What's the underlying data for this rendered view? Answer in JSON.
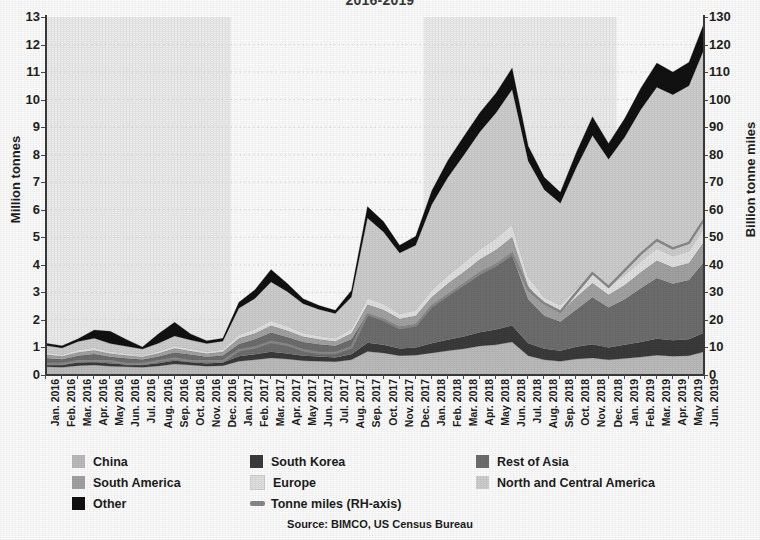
{
  "title": "2016-2019",
  "source": "Source: BIMCO, US Census Bureau",
  "axes": {
    "left_title": "Million tonnes",
    "right_title": "Billion tonne miles",
    "left_ticks": [
      "13",
      "12",
      "11",
      "10",
      "9",
      "8",
      "7",
      "6",
      "5",
      "4",
      "3",
      "2",
      "1",
      "0"
    ],
    "right_ticks": [
      "130",
      "120",
      "110",
      "100",
      "90",
      "80",
      "70",
      "60",
      "50",
      "40",
      "30",
      "20",
      "10",
      "0"
    ]
  },
  "colors": {
    "china": "#bdbdbd",
    "south_korea": "#3b3b3b",
    "rest_of_asia": "#6e6e6e",
    "south_america": "#a3a3a3",
    "europe": "#e2e2e2",
    "north_and_central_america": "#cfcfcf",
    "other": "#111111",
    "tonne_miles_line": "#8a8a8a",
    "band_shade": "#ededed",
    "gridline": "#d9d9d9",
    "axis": "#3b3b3b"
  },
  "legend": [
    {
      "label": "China",
      "marker": "square",
      "color_key": "china"
    },
    {
      "label": "South Korea",
      "marker": "square",
      "color_key": "south_korea"
    },
    {
      "label": "Rest of Asia",
      "marker": "square",
      "color_key": "rest_of_asia"
    },
    {
      "label": "South America",
      "marker": "square",
      "color_key": "south_america"
    },
    {
      "label": "Europe",
      "marker": "square",
      "color_key": "europe"
    },
    {
      "label": "North and Central America",
      "marker": "square",
      "color_key": "north_and_central_america"
    },
    {
      "label": "Other",
      "marker": "square",
      "color_key": "other"
    },
    {
      "label": "Tonne miles (RH-axis)",
      "marker": "line",
      "color_key": "tonne_miles_line"
    }
  ],
  "chart_data": {
    "type": "area",
    "stacked": true,
    "title": "2016-2019",
    "xlabel": "",
    "ylabel": "Million tonnes",
    "y2label": "Billion tonne miles",
    "ylim": [
      0,
      13
    ],
    "y2lim": [
      0,
      130
    ],
    "grid": true,
    "grid_style": "dotted-horizontal",
    "legend_position": "bottom",
    "shaded_year_bands": [
      "2016",
      "2018"
    ],
    "x": [
      "Jan. 2016",
      "Feb. 2016",
      "Mar. 2016",
      "Apr. 2016",
      "May 2016",
      "Jun. 2016",
      "Jul. 2016",
      "Aug. 2016",
      "Sep. 2016",
      "Oct. 2016",
      "Nov. 2016",
      "Dec. 2016",
      "Jan. 2017",
      "Feb. 2017",
      "Mar. 2017",
      "Apr. 2017",
      "May 2017",
      "Jun. 2017",
      "Jul. 2017",
      "Aug. 2017",
      "Sep. 2017",
      "Oct. 2017",
      "Nov. 2017",
      "Dec. 2017",
      "Jan. 2018",
      "Feb. 2018",
      "Mar. 2018",
      "Apr. 2018",
      "May 2018",
      "Jun. 2018",
      "Jul. 2018",
      "Aug. 2018",
      "Sep. 2018",
      "Oct. 2018",
      "Nov. 2018",
      "Dec. 2018",
      "Jan. 2019",
      "Feb. 2019",
      "Mar. 2019",
      "Apr. 2019",
      "May 2019",
      "Jun. 2019"
    ],
    "series": [
      {
        "name": "China",
        "color_key": "china",
        "values": [
          0.3,
          0.28,
          0.34,
          0.36,
          0.32,
          0.3,
          0.28,
          0.33,
          0.4,
          0.36,
          0.32,
          0.34,
          0.5,
          0.55,
          0.62,
          0.58,
          0.52,
          0.5,
          0.48,
          0.55,
          0.85,
          0.8,
          0.7,
          0.72,
          0.8,
          0.88,
          0.95,
          1.05,
          1.1,
          1.2,
          0.7,
          0.55,
          0.5,
          0.58,
          0.62,
          0.55,
          0.6,
          0.65,
          0.72,
          0.68,
          0.7,
          0.85
        ]
      },
      {
        "name": "South Korea",
        "color_key": "south_korea",
        "values": [
          0.1,
          0.09,
          0.11,
          0.12,
          0.1,
          0.09,
          0.08,
          0.1,
          0.12,
          0.11,
          0.1,
          0.11,
          0.18,
          0.2,
          0.22,
          0.2,
          0.18,
          0.17,
          0.16,
          0.2,
          0.32,
          0.3,
          0.26,
          0.28,
          0.35,
          0.4,
          0.45,
          0.5,
          0.55,
          0.6,
          0.45,
          0.4,
          0.38,
          0.45,
          0.5,
          0.45,
          0.5,
          0.55,
          0.6,
          0.58,
          0.6,
          0.7
        ]
      },
      {
        "name": "Rest of Asia",
        "color_key": "rest_of_asia",
        "values": [
          0.22,
          0.2,
          0.25,
          0.28,
          0.24,
          0.22,
          0.2,
          0.24,
          0.3,
          0.27,
          0.24,
          0.26,
          0.45,
          0.55,
          0.7,
          0.6,
          0.5,
          0.45,
          0.42,
          0.55,
          1.05,
          0.95,
          0.8,
          0.85,
          1.3,
          1.6,
          1.85,
          2.1,
          2.3,
          2.55,
          1.6,
          1.2,
          1.05,
          1.35,
          1.7,
          1.45,
          1.65,
          1.95,
          2.2,
          2.05,
          2.15,
          2.6
        ]
      },
      {
        "name": "South America",
        "color_key": "south_america",
        "values": [
          0.12,
          0.11,
          0.13,
          0.14,
          0.12,
          0.11,
          0.1,
          0.12,
          0.15,
          0.13,
          0.12,
          0.13,
          0.2,
          0.22,
          0.26,
          0.24,
          0.2,
          0.18,
          0.17,
          0.22,
          0.34,
          0.32,
          0.28,
          0.3,
          0.38,
          0.44,
          0.5,
          0.55,
          0.6,
          0.66,
          0.48,
          0.4,
          0.36,
          0.45,
          0.52,
          0.46,
          0.52,
          0.58,
          0.64,
          0.6,
          0.62,
          0.74
        ]
      },
      {
        "name": "Europe",
        "color_key": "europe",
        "values": [
          0.08,
          0.07,
          0.09,
          0.1,
          0.08,
          0.07,
          0.06,
          0.08,
          0.1,
          0.09,
          0.08,
          0.09,
          0.14,
          0.16,
          0.18,
          0.16,
          0.14,
          0.13,
          0.12,
          0.16,
          0.24,
          0.22,
          0.19,
          0.21,
          0.26,
          0.3,
          0.34,
          0.38,
          0.42,
          0.46,
          0.34,
          0.28,
          0.25,
          0.31,
          0.36,
          0.32,
          0.36,
          0.4,
          0.44,
          0.42,
          0.43,
          0.52
        ]
      },
      {
        "name": "North and Central America",
        "color_key": "north_and_central_america",
        "values": [
          0.25,
          0.23,
          0.3,
          0.33,
          0.28,
          0.25,
          0.22,
          0.28,
          0.35,
          0.31,
          0.28,
          0.3,
          0.95,
          1.1,
          1.4,
          1.25,
          1.05,
          0.95,
          0.88,
          1.15,
          2.9,
          2.6,
          2.2,
          2.35,
          3.1,
          3.55,
          3.9,
          4.25,
          4.55,
          4.9,
          4.2,
          3.9,
          3.7,
          4.4,
          5.0,
          4.6,
          5.0,
          5.5,
          5.85,
          5.85,
          6.0,
          6.5
        ]
      },
      {
        "name": "Other",
        "color_key": "other",
        "values": [
          0.08,
          0.08,
          0.1,
          0.3,
          0.45,
          0.25,
          0.08,
          0.35,
          0.5,
          0.22,
          0.1,
          0.1,
          0.22,
          0.32,
          0.45,
          0.3,
          0.18,
          0.14,
          0.12,
          0.24,
          0.42,
          0.38,
          0.28,
          0.33,
          0.5,
          0.62,
          0.68,
          0.7,
          0.72,
          0.78,
          0.55,
          0.45,
          0.4,
          0.55,
          0.68,
          0.58,
          0.68,
          0.78,
          0.88,
          0.82,
          0.86,
          0.95
        ]
      }
    ],
    "line_series": {
      "name": "Tonne miles (RH-axis)",
      "color_key": "tonne_miles_line",
      "axis": "right",
      "unit": "billion tonne miles",
      "values": [
        4,
        4,
        5,
        5,
        5,
        4,
        4,
        5,
        6,
        5,
        5,
        5,
        9,
        10,
        12,
        11,
        9,
        8,
        8,
        10,
        22,
        20,
        17,
        18,
        25,
        29,
        33,
        37,
        40,
        44,
        31,
        26,
        23,
        30,
        37,
        32,
        38,
        44,
        49,
        46,
        48,
        57
      ]
    }
  }
}
